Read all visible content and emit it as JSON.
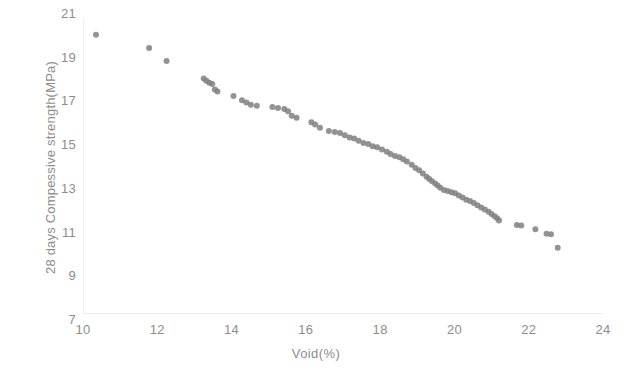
{
  "chart_data": {
    "type": "scatter",
    "title": "",
    "xlabel": "Void(%)",
    "ylabel": "28 days Compessive strength(MPa)",
    "xlim": [
      10,
      24
    ],
    "ylim": [
      7,
      21
    ],
    "xticks": [
      10,
      12,
      14,
      16,
      18,
      20,
      22,
      24
    ],
    "yticks": [
      7,
      9,
      11,
      13,
      15,
      17,
      19,
      21
    ],
    "grid": false,
    "legend": null,
    "marker": {
      "shape": "circle",
      "color": "#808080",
      "size": 6,
      "opacity": 0.85
    },
    "series": [
      {
        "name": "Void vs 28 days compressive strength",
        "points": [
          [
            10.35,
            20.05
          ],
          [
            11.78,
            19.45
          ],
          [
            12.25,
            18.85
          ],
          [
            13.25,
            18.05
          ],
          [
            13.32,
            17.95
          ],
          [
            13.4,
            17.85
          ],
          [
            13.48,
            17.8
          ],
          [
            13.55,
            17.55
          ],
          [
            13.62,
            17.45
          ],
          [
            14.05,
            17.25
          ],
          [
            14.28,
            17.05
          ],
          [
            14.4,
            16.95
          ],
          [
            14.52,
            16.85
          ],
          [
            14.68,
            16.8
          ],
          [
            15.1,
            16.75
          ],
          [
            15.25,
            16.7
          ],
          [
            15.42,
            16.65
          ],
          [
            15.52,
            16.55
          ],
          [
            15.62,
            16.35
          ],
          [
            15.75,
            16.25
          ],
          [
            16.15,
            16.05
          ],
          [
            16.25,
            15.95
          ],
          [
            16.38,
            15.8
          ],
          [
            16.62,
            15.65
          ],
          [
            16.78,
            15.6
          ],
          [
            16.92,
            15.55
          ],
          [
            17.05,
            15.45
          ],
          [
            17.18,
            15.35
          ],
          [
            17.3,
            15.3
          ],
          [
            17.42,
            15.2
          ],
          [
            17.55,
            15.1
          ],
          [
            17.68,
            15.05
          ],
          [
            17.8,
            14.95
          ],
          [
            17.92,
            14.9
          ],
          [
            18.05,
            14.8
          ],
          [
            18.18,
            14.7
          ],
          [
            18.28,
            14.6
          ],
          [
            18.4,
            14.5
          ],
          [
            18.52,
            14.45
          ],
          [
            18.62,
            14.35
          ],
          [
            18.72,
            14.25
          ],
          [
            18.85,
            14.1
          ],
          [
            18.95,
            13.95
          ],
          [
            19.05,
            13.85
          ],
          [
            19.15,
            13.7
          ],
          [
            19.25,
            13.55
          ],
          [
            19.32,
            13.45
          ],
          [
            19.4,
            13.35
          ],
          [
            19.48,
            13.25
          ],
          [
            19.55,
            13.15
          ],
          [
            19.62,
            13.05
          ],
          [
            19.72,
            12.95
          ],
          [
            19.82,
            12.9
          ],
          [
            19.92,
            12.85
          ],
          [
            20.02,
            12.8
          ],
          [
            20.12,
            12.7
          ],
          [
            20.22,
            12.6
          ],
          [
            20.32,
            12.5
          ],
          [
            20.42,
            12.45
          ],
          [
            20.52,
            12.35
          ],
          [
            20.62,
            12.25
          ],
          [
            20.72,
            12.15
          ],
          [
            20.82,
            12.05
          ],
          [
            20.92,
            11.95
          ],
          [
            21.0,
            11.85
          ],
          [
            21.08,
            11.75
          ],
          [
            21.15,
            11.65
          ],
          [
            21.2,
            11.55
          ],
          [
            21.68,
            11.35
          ],
          [
            21.8,
            11.32
          ],
          [
            22.18,
            11.15
          ],
          [
            22.48,
            10.95
          ],
          [
            22.6,
            10.92
          ],
          [
            22.78,
            10.3
          ]
        ]
      }
    ]
  }
}
